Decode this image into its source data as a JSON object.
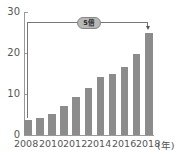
{
  "chart_data": {
    "type": "bar",
    "title": "",
    "xlabel": "(年)",
    "ylabel": "",
    "ylim": [
      0,
      30
    ],
    "yticks": [
      "0",
      "10",
      "20",
      "30"
    ],
    "xtick_labels": [
      "2008",
      "2010",
      "2012",
      "2014",
      "2016",
      "2018"
    ],
    "categories": [
      "2008",
      "2009",
      "2010",
      "2011",
      "2012",
      "2013",
      "2014",
      "2015",
      "2016",
      "2017",
      "2018"
    ],
    "values": [
      3.7,
      4.1,
      5.2,
      7.0,
      9.3,
      11.4,
      14.1,
      14.8,
      16.6,
      19.7,
      25.0
    ],
    "bar_color": "#8c8c8c",
    "grid": false,
    "annotation": {
      "label": "5倍",
      "from": "2008",
      "to": "2018"
    }
  }
}
